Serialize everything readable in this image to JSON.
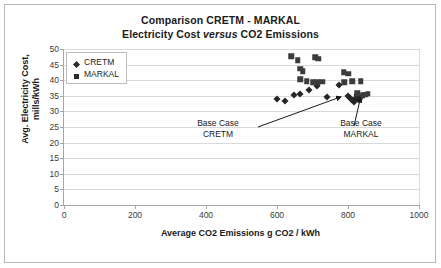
{
  "chart_data": {
    "type": "scatter",
    "title": "Comparison CRETM - MARKAL",
    "subtitle_prefix": "Electricity Cost ",
    "subtitle_italic": "versus",
    "subtitle_suffix": "  CO2 Emissions",
    "xlabel": "Average CO2 Emissions g CO2 / kWh",
    "ylabel_line1": "Avg. Electricity Cost,",
    "ylabel_line2": "mills/kWh",
    "xlim": [
      0,
      1000
    ],
    "ylim": [
      0,
      50
    ],
    "xticks": [
      0,
      200,
      400,
      600,
      800,
      1000
    ],
    "yticks": [
      0,
      5,
      10,
      15,
      20,
      25,
      30,
      35,
      40,
      45,
      50
    ],
    "grid": "horizontal",
    "legend_position": "top-left-inside",
    "series": [
      {
        "name": "CRETM",
        "marker": "diamond",
        "color": "#262626",
        "points": [
          [
            600,
            34.0
          ],
          [
            622,
            33.2
          ],
          [
            648,
            35.4
          ],
          [
            666,
            35.6
          ],
          [
            690,
            36.8
          ],
          [
            712,
            38.0
          ],
          [
            742,
            34.7
          ],
          [
            776,
            38.4
          ],
          [
            800,
            34.8
          ],
          [
            806,
            34.2
          ],
          [
            812,
            33.6
          ],
          [
            818,
            33.0
          ],
          [
            822,
            34.4
          ],
          [
            826,
            35.2
          ],
          [
            830,
            33.8
          ],
          [
            836,
            34.6
          ]
        ]
      },
      {
        "name": "MARKAL",
        "marker": "square",
        "color": "#3c3c3c",
        "points": [
          [
            640,
            47.6
          ],
          [
            658,
            46.4
          ],
          [
            708,
            47.4
          ],
          [
            716,
            46.8
          ],
          [
            666,
            43.6
          ],
          [
            672,
            42.8
          ],
          [
            666,
            40.3
          ],
          [
            684,
            39.6
          ],
          [
            700,
            39.4
          ],
          [
            714,
            39.4
          ],
          [
            728,
            39.5
          ],
          [
            788,
            42.6
          ],
          [
            800,
            42.0
          ],
          [
            790,
            39.4
          ],
          [
            812,
            39.6
          ],
          [
            836,
            39.6
          ],
          [
            826,
            35.8
          ],
          [
            842,
            35.2
          ],
          [
            848,
            35.4
          ],
          [
            856,
            35.6
          ]
        ]
      }
    ],
    "annotations": [
      {
        "id": "base-case-cretm",
        "line1": "Base Case",
        "line2": "CRETM",
        "target_x": 800,
        "target_y": 35.0
      },
      {
        "id": "base-case-markal",
        "line1": "Base Case",
        "line2": "MARKAL",
        "target_x": 838,
        "target_y": 35.4
      }
    ]
  },
  "legend": {
    "items": [
      {
        "label": "CRETM",
        "marker": "diamond"
      },
      {
        "label": "MARKAL",
        "marker": "square"
      }
    ]
  }
}
